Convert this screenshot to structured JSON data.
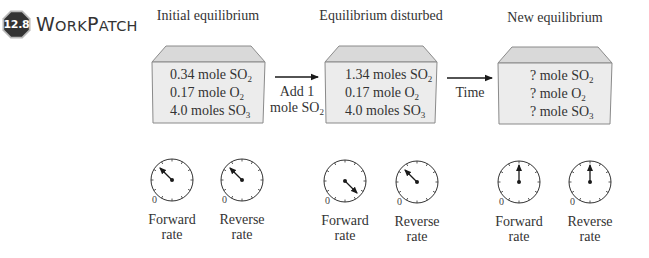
{
  "header": {
    "badge_number": "12.8",
    "title_initial_w": "W",
    "title_small_1": "ORK",
    "title_initial_p": "P",
    "title_small_2": "ATCH"
  },
  "stages": [
    {
      "title": "Initial equilibrium",
      "lines": [
        {
          "text": "0.34 mole SO",
          "sub": "2"
        },
        {
          "text": "0.17 mole O",
          "sub": "2"
        },
        {
          "text": "4.0 moles SO",
          "sub": "3"
        }
      ],
      "forward_gauge": {
        "label_1": "Forward",
        "label_2": "rate",
        "zero": "0",
        "needle_angle_deg": -45
      },
      "reverse_gauge": {
        "label_1": "Reverse",
        "label_2": "rate",
        "zero": "0",
        "needle_angle_deg": -45
      }
    },
    {
      "title": "Equilibrium disturbed",
      "lines": [
        {
          "text": "1.34 moles SO",
          "sub": "2"
        },
        {
          "text": "0.17 mole O",
          "sub": "2"
        },
        {
          "text": "4.0 moles SO",
          "sub": "3"
        }
      ],
      "forward_gauge": {
        "label_1": "Forward",
        "label_2": "rate",
        "zero": "0",
        "needle_angle_deg": 135
      },
      "reverse_gauge": {
        "label_1": "Reverse",
        "label_2": "rate",
        "zero": "0",
        "needle_angle_deg": -45
      }
    },
    {
      "title": "New equilibrium",
      "lines": [
        {
          "text": "? mole SO",
          "sub": "2"
        },
        {
          "text": "? mole O",
          "sub": "2"
        },
        {
          "text": "? mole SO",
          "sub": "3"
        }
      ],
      "forward_gauge": {
        "label_1": "Forward",
        "label_2": "rate",
        "zero": "0",
        "needle_angle_deg": 0
      },
      "reverse_gauge": {
        "label_1": "Reverse",
        "label_2": "rate",
        "zero": "0",
        "needle_angle_deg": 0
      }
    }
  ],
  "arrows": [
    {
      "label_1": "Add 1",
      "label_2": "mole SO",
      "label_2_sub": "2"
    },
    {
      "label_1": "Time"
    }
  ],
  "colors": {
    "badge_fill": "#333333",
    "badge_border": "#b8b8b8",
    "box_top": "#d9d9d9",
    "box_front": "#ececec",
    "box_outline": "#8a8a8a",
    "ink": "#2a2a2a"
  }
}
